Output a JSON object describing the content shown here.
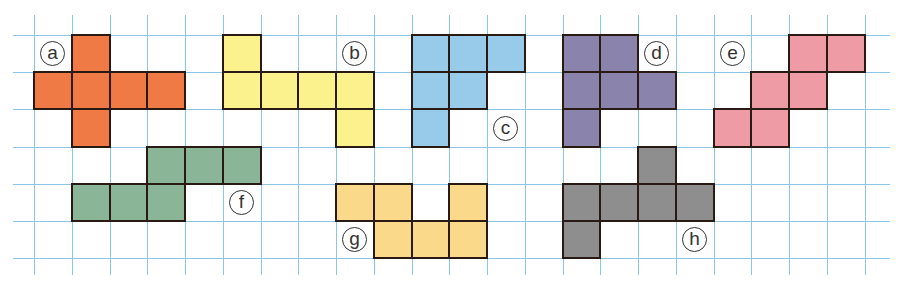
{
  "grid": {
    "origin_x": 34,
    "origin_y": 35,
    "cell_w": 37.75,
    "cell_h": 37.2,
    "cols": 23,
    "rows": 7,
    "line_color": "#8cc6e6"
  },
  "shapes": [
    {
      "id": "a",
      "label": "a",
      "color": "#f07a45",
      "cells": [
        [
          1,
          0
        ],
        [
          0,
          1
        ],
        [
          1,
          1
        ],
        [
          2,
          1
        ],
        [
          3,
          1
        ],
        [
          1,
          2
        ]
      ],
      "label_cell": [
        0,
        0
      ]
    },
    {
      "id": "b",
      "label": "b",
      "color": "#fbf28e",
      "cells": [
        [
          5,
          0
        ],
        [
          5,
          1
        ],
        [
          6,
          1
        ],
        [
          7,
          1
        ],
        [
          8,
          1
        ],
        [
          8,
          2
        ]
      ],
      "label_cell": [
        8,
        0
      ]
    },
    {
      "id": "c",
      "label": "c",
      "color": "#98caea",
      "cells": [
        [
          10,
          0
        ],
        [
          11,
          0
        ],
        [
          12,
          0
        ],
        [
          10,
          1
        ],
        [
          11,
          1
        ],
        [
          10,
          2
        ]
      ],
      "label_cell": [
        12,
        2
      ]
    },
    {
      "id": "d",
      "label": "d",
      "color": "#8a84ad",
      "cells": [
        [
          14,
          0
        ],
        [
          15,
          0
        ],
        [
          14,
          1
        ],
        [
          15,
          1
        ],
        [
          16,
          1
        ],
        [
          14,
          2
        ]
      ],
      "label_cell": [
        16,
        0
      ]
    },
    {
      "id": "e",
      "label": "e",
      "color": "#ee9ba5",
      "cells": [
        [
          20,
          0
        ],
        [
          21,
          0
        ],
        [
          19,
          1
        ],
        [
          20,
          1
        ],
        [
          18,
          2
        ],
        [
          19,
          2
        ]
      ],
      "label_cell": [
        18,
        0
      ]
    },
    {
      "id": "f",
      "label": "f",
      "color": "#8ab597",
      "cells": [
        [
          3,
          3
        ],
        [
          4,
          3
        ],
        [
          5,
          3
        ],
        [
          1,
          4
        ],
        [
          2,
          4
        ],
        [
          3,
          4
        ]
      ],
      "label_cell": [
        5,
        4
      ]
    },
    {
      "id": "g",
      "label": "g",
      "color": "#fbd98a",
      "cells": [
        [
          8,
          4
        ],
        [
          9,
          4
        ],
        [
          11,
          4
        ],
        [
          9,
          5
        ],
        [
          10,
          5
        ],
        [
          11,
          5
        ]
      ],
      "label_cell": [
        8,
        5
      ]
    },
    {
      "id": "h",
      "label": "h",
      "color": "#8e8e8e",
      "cells": [
        [
          16,
          3
        ],
        [
          14,
          4
        ],
        [
          15,
          4
        ],
        [
          16,
          4
        ],
        [
          17,
          4
        ],
        [
          14,
          5
        ]
      ],
      "label_cell": [
        17,
        5
      ]
    }
  ]
}
